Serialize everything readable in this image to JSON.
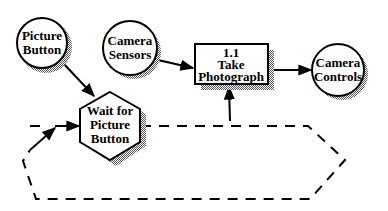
{
  "diagram": {
    "type": "data-flow / control-flow diagram",
    "nodes": [
      {
        "id": "picture-button",
        "shape": "circle",
        "lines": [
          "Picture",
          "Button"
        ]
      },
      {
        "id": "camera-sensors",
        "shape": "circle",
        "lines": [
          "Camera",
          "Sensors"
        ]
      },
      {
        "id": "take-photograph",
        "shape": "rectangle",
        "lines": [
          "1.1",
          "Take",
          "Photograph"
        ]
      },
      {
        "id": "camera-controls",
        "shape": "circle",
        "lines": [
          "Camera",
          "Controls"
        ]
      },
      {
        "id": "wait-for-picture-button",
        "shape": "hexagon",
        "lines": [
          "Wait for",
          "Picture",
          "Button"
        ]
      }
    ],
    "edges": [
      {
        "from": "picture-button",
        "to": "wait-for-picture-button",
        "style": "solid"
      },
      {
        "from": "camera-sensors",
        "to": "take-photograph",
        "style": "solid"
      },
      {
        "from": "take-photograph",
        "to": "camera-controls",
        "style": "solid"
      },
      {
        "from": "wait-for-picture-button",
        "to": "take-photograph",
        "style": "dashed"
      },
      {
        "from": "wait-for-picture-button",
        "to": "wait-for-picture-button",
        "style": "dashed",
        "note": "loop back"
      }
    ],
    "colors": {
      "stroke": "#000000",
      "fill": "#ffffff",
      "shadow": "#888888"
    }
  }
}
